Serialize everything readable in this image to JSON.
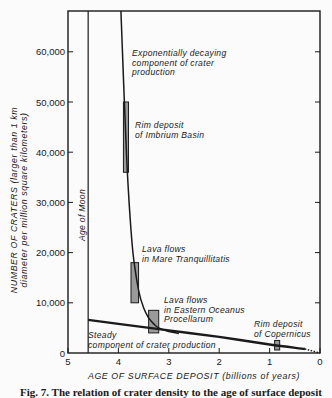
{
  "chart_data": {
    "type": "line",
    "title": "",
    "xlabel": "AGE OF SURFACE DEPOSIT (billions of years)",
    "ylabel": "NUMBER OF CRATERS (larger than 1 km diameter per million square kilometers)",
    "ylabel_line1": "NUMBER OF CRATERS (larger than 1 km",
    "ylabel_line2": "diameter per million square kilometers)",
    "xlim": [
      5,
      0
    ],
    "ylim": [
      0,
      70000
    ],
    "x_ticks": [
      "5",
      "4",
      "3",
      "2",
      "1",
      "0"
    ],
    "y_ticks": [
      "0",
      "10,000",
      "20,000",
      "30,000",
      "40,000",
      "50,000",
      "60,000"
    ],
    "grid": false,
    "series": [
      {
        "name": "Exponentially decaying component of crater production",
        "label_lines": [
          "Exponentially decaying",
          "component of crater",
          "production"
        ],
        "x": [
          3.95,
          3.9,
          3.85,
          3.8,
          3.75,
          3.7,
          3.6,
          3.5,
          3.4,
          3.3,
          3.2,
          3.0,
          2.8
        ],
        "y": [
          72000,
          55000,
          42000,
          32000,
          24500,
          19000,
          12500,
          9000,
          7000,
          5800,
          5000,
          4300,
          3900
        ]
      },
      {
        "name": "Steady component of crater production",
        "label_lines": [
          "Steady",
          "component of crater production"
        ],
        "x": [
          4.6,
          4.0,
          3.0,
          2.0,
          1.0,
          0.3
        ],
        "y": [
          6600,
          5800,
          4500,
          3200,
          1700,
          800
        ],
        "extension_dotted": {
          "x": [
            0.3,
            0
          ],
          "y": [
            800,
            0
          ]
        }
      }
    ],
    "reference_lines": [
      {
        "name": "Age of Moon",
        "x": 4.6
      }
    ],
    "data_boxes": [
      {
        "name": "Rim deposit of Imbrium Basin",
        "label_lines": [
          "Rim deposit",
          "of Imbrium Basin"
        ],
        "x_range": [
          3.9,
          3.8
        ],
        "y_range": [
          36000,
          50000
        ]
      },
      {
        "name": "Lava flows in Mare Tranquillitatis",
        "label_lines": [
          "Lava flows",
          "in Mare Tranquillitatis"
        ],
        "x_range": [
          3.75,
          3.6
        ],
        "y_range": [
          10000,
          18000
        ]
      },
      {
        "name": "Lava flows in Eastern Oceanus Procellarum",
        "label_lines": [
          "Lava flows",
          "in Eastern Oceanus",
          "Procellarum"
        ],
        "x_range": [
          3.4,
          3.2
        ],
        "y_range": [
          4000,
          8500
        ]
      },
      {
        "name": "Rim deposit of Copernicus",
        "label_lines": [
          "Rim deposit",
          "of Copernicus"
        ],
        "x_range": [
          0.9,
          0.8
        ],
        "y_range": [
          600,
          2500
        ]
      }
    ],
    "annotations": [
      "Age of Moon"
    ]
  },
  "caption": "Fig. 7. The relation of crater density to the age of surface deposit"
}
